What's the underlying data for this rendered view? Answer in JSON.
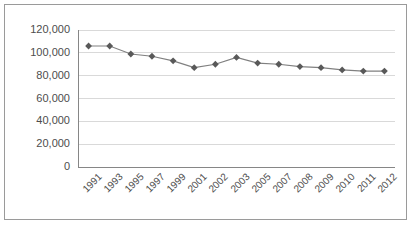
{
  "chart_data": {
    "type": "line",
    "title": "",
    "xlabel": "",
    "ylabel": "",
    "categories": [
      "1991",
      "1993",
      "1995",
      "1997",
      "1999",
      "2001",
      "2002",
      "2003",
      "2005",
      "2007",
      "2008",
      "2009",
      "2010",
      "2011",
      "2012"
    ],
    "values": [
      106000,
      106000,
      99000,
      97000,
      93000,
      87000,
      90000,
      96000,
      91000,
      90000,
      88000,
      87000,
      85000,
      84000,
      84000
    ],
    "series": [
      {
        "name": "series-1",
        "values": [
          106000,
          106000,
          99000,
          97000,
          93000,
          87000,
          90000,
          96000,
          91000,
          90000,
          88000,
          87000,
          85000,
          84000,
          84000
        ]
      }
    ],
    "ylim": [
      0,
      120000
    ],
    "yticks": [
      0,
      20000,
      40000,
      60000,
      80000,
      100000,
      120000
    ],
    "ytick_labels": [
      "0",
      "20,000",
      "40,000",
      "60,000",
      "80,000",
      "100,000",
      "120,000"
    ],
    "grid": true,
    "grid_axis": "y",
    "legend": false,
    "legend_position": "none",
    "marker": "diamond",
    "line_color": "#808080",
    "marker_color": "#595959",
    "grid_color": "#d9d9d9",
    "axis_color": "#868686",
    "border_color": "#9a9a9a",
    "plot_background": "#ffffff"
  }
}
